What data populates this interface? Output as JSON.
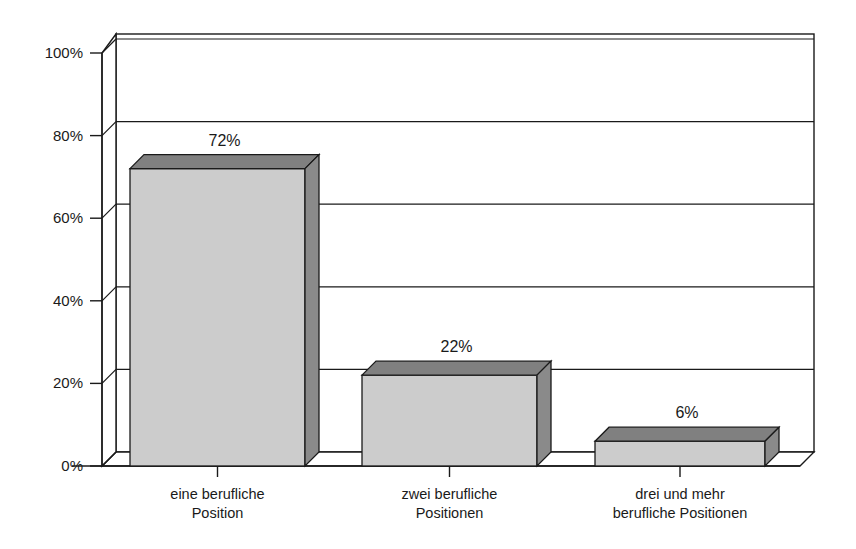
{
  "chart_data": {
    "type": "bar",
    "title": "",
    "subtitle": "",
    "xlabel": "",
    "ylabel": "",
    "categories": [
      "eine berufliche Position",
      "zwei berufliche Positionen",
      "drei und mehr berufliche Positionen"
    ],
    "category_lines": [
      [
        "eine berufliche",
        "Position"
      ],
      [
        "zwei berufliche",
        "Positionen"
      ],
      [
        "drei und mehr",
        "berufliche Positionen"
      ]
    ],
    "values": [
      72,
      22,
      6
    ],
    "data_labels": [
      "72%",
      "22%",
      "6%"
    ],
    "ylim": [
      0,
      100
    ],
    "ytick_values": [
      0,
      20,
      40,
      60,
      80,
      100
    ],
    "ytick_labels": [
      "0%",
      "20%",
      "40%",
      "60%",
      "80%",
      "100%"
    ],
    "grid": true,
    "grid_axis": "y",
    "legend": false,
    "legend_position": "none",
    "style": "3d-column",
    "series": [
      {
        "name": "Anteil",
        "values": [
          72,
          22,
          6
        ]
      }
    ]
  },
  "colors": {
    "bar_face": "#cccccc",
    "bar_top": "#808080",
    "bar_side": "#8a8a8a",
    "outline": "#1a1a1a",
    "grid": "#1a1a1a",
    "background": "#ffffff",
    "text": "#1a1a1a"
  }
}
